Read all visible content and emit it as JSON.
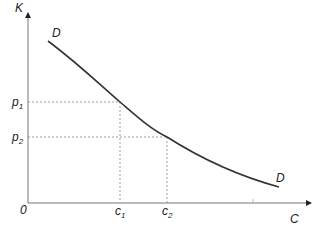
{
  "diagram": {
    "type": "demand-curve",
    "axes": {
      "y_label": "K",
      "x_label": "C",
      "origin_label": "0"
    },
    "curve": {
      "label_start": "D",
      "label_end": "D"
    },
    "y_ticks": [
      {
        "main": "p",
        "sub": "1"
      },
      {
        "main": "p",
        "sub": "2"
      }
    ],
    "x_ticks": [
      {
        "main": "c",
        "sub": "1"
      },
      {
        "main": "c",
        "sub": "2"
      }
    ],
    "colors": {
      "axis": "#777777",
      "curve": "#333333",
      "guide": "#888888"
    }
  }
}
